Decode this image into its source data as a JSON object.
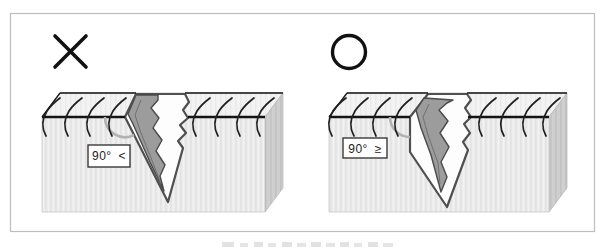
{
  "figure": {
    "panels": [
      {
        "id": "left",
        "verdict": "incorrect",
        "mark_icon": "cross-mark",
        "mark_glyph": "×",
        "angle_label": "90° <"
      },
      {
        "id": "right",
        "verdict": "correct",
        "mark_icon": "circle-mark",
        "mark_glyph": "○",
        "angle_label": "90° ≥"
      }
    ],
    "colors": {
      "outline": "#1a1a1a",
      "wound_outline": "#4f4f4f",
      "lesion_fill": "#9c9c9c",
      "angle_arc": "#b2b2b2",
      "skin_front": "#ececec",
      "skin_top": "#f3f3f3",
      "skin_side": "#cfcfcf",
      "frame_border": "#bdbdbd",
      "background": "#ffffff"
    }
  }
}
